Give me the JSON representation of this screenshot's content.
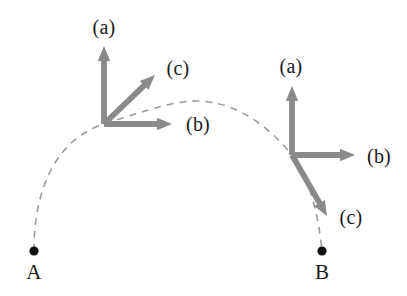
{
  "figure": {
    "width": 407,
    "height": 296,
    "background_color": "#ffffff",
    "vector_color": "#8a8a8a",
    "trajectory_color": "#9a9a9a",
    "point_color": "#111111",
    "label_color": "#1a1a1a"
  },
  "trajectory": {
    "name": "dashed-arc",
    "style": "dashed",
    "start_point_label": "A",
    "end_point_label": "B",
    "start_point": {
      "x": 34,
      "y": 251
    },
    "end_point": {
      "x": 322,
      "y": 251
    },
    "apex": {
      "x": 196,
      "y": 101
    },
    "path": "M 34 251 C 34 190 55 140 104 124 C 150 109 176 101 196 101 C 228 101 262 118 292 155 C 308 176 318 210 322 251"
  },
  "frames": [
    {
      "name": "frame-A",
      "origin": {
        "x": 104,
        "y": 124
      },
      "vectors": [
        {
          "name": "a",
          "label": "(a)",
          "tip": {
            "x": 104,
            "y": 46
          },
          "label_pos": {
            "x": 104,
            "y": 27
          }
        },
        {
          "name": "b",
          "label": "(b)",
          "tip": {
            "x": 172,
            "y": 124
          },
          "label_pos": {
            "x": 198,
            "y": 124
          }
        },
        {
          "name": "c",
          "label": "(c)",
          "tip": {
            "x": 155,
            "y": 75
          },
          "label_pos": {
            "x": 178,
            "y": 68
          }
        }
      ]
    },
    {
      "name": "frame-B",
      "origin": {
        "x": 292,
        "y": 155
      },
      "vectors": [
        {
          "name": "a",
          "label": "(a)",
          "tip": {
            "x": 292,
            "y": 86
          },
          "label_pos": {
            "x": 291,
            "y": 66
          }
        },
        {
          "name": "b",
          "label": "(b)",
          "tip": {
            "x": 355,
            "y": 155
          },
          "label_pos": {
            "x": 379,
            "y": 156
          }
        },
        {
          "name": "c",
          "label": "(c)",
          "tip": {
            "x": 327,
            "y": 216
          },
          "label_pos": {
            "x": 351,
            "y": 217
          }
        }
      ]
    }
  ],
  "endpoints": [
    {
      "name": "point-A",
      "label": "A",
      "dot": {
        "x": 34,
        "y": 251
      },
      "label_pos": {
        "x": 34,
        "y": 272
      }
    },
    {
      "name": "point-B",
      "label": "B",
      "dot": {
        "x": 322,
        "y": 251
      },
      "label_pos": {
        "x": 322,
        "y": 272
      }
    }
  ]
}
